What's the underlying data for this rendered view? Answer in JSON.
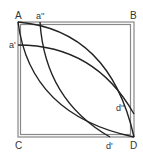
{
  "diagram": {
    "labels": {
      "A": "A",
      "B": "B",
      "C": "C",
      "D": "D",
      "a1": "a'",
      "a2": "a''",
      "d1": "d'",
      "d2": "d''"
    },
    "colors": {
      "stroke": "#222222",
      "frame": "#888888",
      "text": "#333333"
    }
  }
}
